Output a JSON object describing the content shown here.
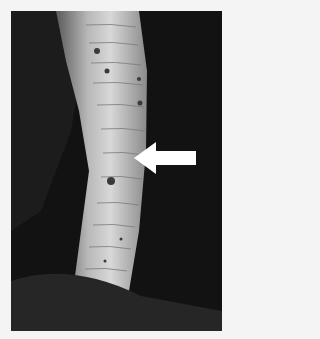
{
  "image": {
    "subject": "snake ventral scales",
    "background_color": "#121212",
    "page_color": "#f4f4f4",
    "annotation": {
      "type": "arrow",
      "direction": "left",
      "color": "#ffffff"
    }
  }
}
